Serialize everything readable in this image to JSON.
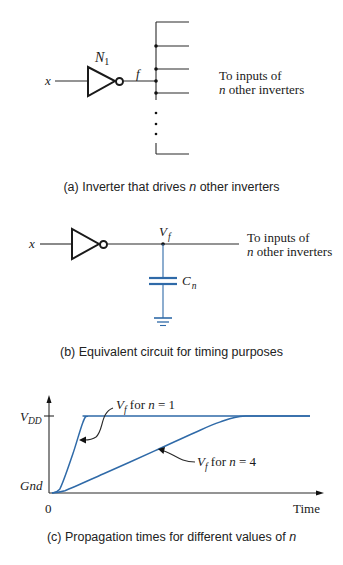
{
  "panel_a": {
    "input_label": "x",
    "gate_label": "N",
    "gate_subscript": "1",
    "output_label": "f",
    "note_line1": "To inputs of",
    "note_line2_var": "n",
    "note_line2_rest": " other inverters",
    "caption_prefix": "(a) Inverter that drives ",
    "caption_var": "n",
    "caption_suffix": " other inverters"
  },
  "panel_b": {
    "input_label": "x",
    "node_label": "V",
    "node_subscript": "f",
    "cap_label": "C",
    "cap_subscript": "n",
    "note_line1": "To inputs of",
    "note_line2_var": "n",
    "note_line2_rest": " other inverters",
    "caption": "(b) Equivalent circuit for timing purposes"
  },
  "panel_c": {
    "y_top_label": "V",
    "y_top_subscript": "DD",
    "y_bottom_label": "Gnd",
    "x_origin_label": "0",
    "x_axis_label": "Time",
    "annot_n1_var": "V",
    "annot_n1_sub": "f",
    "annot_n1_rest": " for ",
    "annot_n1_n": "n",
    "annot_n1_eq": " = 1",
    "annot_n4_var": "V",
    "annot_n4_sub": "f",
    "annot_n4_rest": " for ",
    "annot_n4_n": "n",
    "annot_n4_eq": " = 4",
    "caption_prefix": "(c) Propagation times for different values of ",
    "caption_var": "n",
    "curve_color": "#2f6aa8"
  },
  "chart_data": {
    "type": "line",
    "title": "(c) Propagation times for different values of n",
    "xlabel": "Time",
    "ylabel": "",
    "y_ticks": [
      "Gnd",
      "VDD"
    ],
    "x_ticks": [
      "0"
    ],
    "series": [
      {
        "name": "V_f for n = 1",
        "x": [
          0,
          0.03,
          0.08,
          0.12,
          0.14,
          0.2,
          1.0
        ],
        "y": [
          0,
          0.05,
          0.5,
          0.92,
          1.0,
          1.0,
          1.0
        ]
      },
      {
        "name": "V_f for n = 4",
        "x": [
          0,
          0.05,
          0.2,
          0.4,
          0.55,
          0.65,
          0.75,
          1.0
        ],
        "y": [
          0,
          0.03,
          0.25,
          0.55,
          0.78,
          0.92,
          1.0,
          1.0
        ]
      }
    ]
  }
}
